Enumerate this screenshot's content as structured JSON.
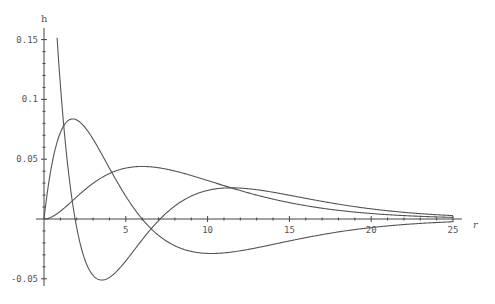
{
  "chart_data": {
    "type": "line",
    "title": "",
    "xlabel": "r",
    "ylabel": "h",
    "xlim": [
      0,
      25
    ],
    "ylim": [
      -0.055,
      0.16
    ],
    "grid": false,
    "legend": null,
    "x_ticks": [
      5,
      10,
      15,
      20,
      25
    ],
    "x_tick_labels": [
      "5",
      "10",
      "15",
      "20",
      "25"
    ],
    "y_ticks": [
      -0.05,
      0.05,
      0.1,
      0.15
    ],
    "y_tick_labels": [
      "-0.05",
      "0.05",
      "0.1",
      "0.15"
    ],
    "series": [
      {
        "name": "curve-1",
        "description": "starts very high near r=0, crosses zero at r~1.9, minimum ~-0.051 at r~3.5, crosses zero at r~7.1, peak ~0.024 at r~12, decays to 0",
        "x": [
          0.6,
          1,
          1.5,
          2,
          2.5,
          3,
          3.5,
          4,
          5,
          6,
          7,
          8,
          9,
          10,
          11,
          12,
          13,
          14,
          15,
          17,
          19,
          21,
          23,
          25
        ],
        "values": [
          0.201,
          0.119,
          0.043,
          -0.005,
          -0.033,
          -0.047,
          -0.051,
          -0.05,
          -0.04,
          -0.023,
          -0.001,
          0.011,
          0.02,
          0.023,
          0.024,
          0.024,
          0.022,
          0.02,
          0.017,
          0.012,
          0.008,
          0.005,
          0.003,
          0.002
        ]
      },
      {
        "name": "curve-2",
        "description": "starts at 0, peak ~0.083 at r~1.8, crosses zero at r~6, minimum ~-0.029 at r~10, decays to 0",
        "x": [
          0,
          0.5,
          1,
          1.5,
          2,
          2.5,
          3,
          4,
          5,
          6,
          7,
          8,
          9,
          10,
          11,
          12,
          14,
          16,
          18,
          20,
          22,
          25
        ],
        "values": [
          0,
          0.047,
          0.072,
          0.082,
          0.083,
          0.078,
          0.045,
          0.042,
          0.019,
          0,
          -0.014,
          -0.022,
          -0.027,
          -0.029,
          -0.028,
          -0.026,
          -0.021,
          -0.015,
          -0.011,
          -0.007,
          -0.004,
          -0.002
        ],
        "note": "see render script for analytic evaluation"
      },
      {
        "name": "curve-3",
        "description": "starts at 0, peak ~0.044 at r~6, decays to 0",
        "x": [
          0,
          1,
          2,
          3,
          4,
          5,
          6,
          7,
          8,
          9,
          10,
          12,
          14,
          16,
          18,
          20,
          22,
          25
        ],
        "values": [
          0,
          0.006,
          0.019,
          0.03,
          0.038,
          0.043,
          0.044,
          0.043,
          0.04,
          0.036,
          0.032,
          0.024,
          0.017,
          0.011,
          0.007,
          0.005,
          0.003,
          0.001
        ]
      }
    ]
  },
  "axes": {
    "x_axis_label": "r",
    "y_axis_label": "h"
  }
}
